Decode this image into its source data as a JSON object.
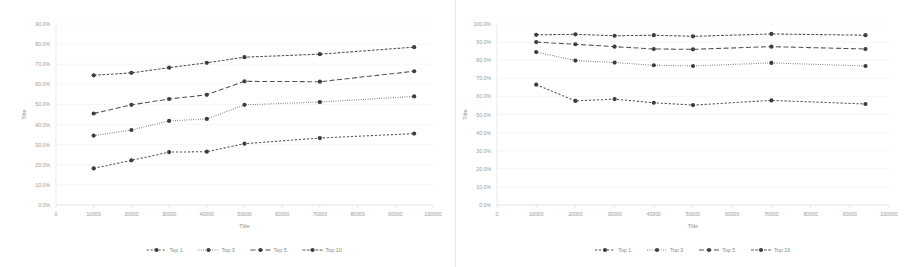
{
  "page": {
    "background": "#ffffff",
    "accent": "#545454",
    "panel_count": 2
  },
  "charts": [
    {
      "id": "left-chart",
      "name": "accuracy-vs-training-size-chart-left",
      "chart_data": {
        "type": "line",
        "title": "",
        "xlabel": "Title",
        "ylabel": "Title",
        "xlim": [
          0,
          100000
        ],
        "ylim": [
          0,
          0.9
        ],
        "xticks": [
          0,
          10000,
          20000,
          30000,
          40000,
          50000,
          60000,
          70000,
          80000,
          90000,
          100000
        ],
        "xticklabels": [
          "0",
          "10000",
          "20000",
          "30000",
          "40000",
          "50000",
          "60000",
          "70000",
          "80000",
          "90000",
          "100000"
        ],
        "yticks": [
          0,
          0.1,
          0.2,
          0.3,
          0.4,
          0.5,
          0.6,
          0.7,
          0.8,
          0.9
        ],
        "yticklabels": [
          "0.0%",
          "10.0%",
          "20.0%",
          "30.0%",
          "40.0%",
          "50.0%",
          "60.0%",
          "70.0%",
          "80.0%",
          "90.0%"
        ],
        "grid": true,
        "legend_position": "bottom",
        "x": [
          10000,
          20000,
          30000,
          40000,
          50000,
          70000,
          95000
        ],
        "series": [
          {
            "name": "Top 1",
            "dash": "2.2 1.8",
            "values": [
              0.182,
              0.222,
              0.263,
              0.265,
              0.305,
              0.333,
              0.355
            ]
          },
          {
            "name": "Top 3",
            "dash": "0.7 1.6",
            "values": [
              0.345,
              0.373,
              0.418,
              0.428,
              0.498,
              0.512,
              0.54
            ]
          },
          {
            "name": "Top 5",
            "dash": "5 2.5",
            "values": [
              0.455,
              0.498,
              0.527,
              0.548,
              0.615,
              0.613,
              0.665
            ]
          },
          {
            "name": "Top 10",
            "dash": "2.8 1.5",
            "values": [
              0.645,
              0.657,
              0.683,
              0.707,
              0.735,
              0.75,
              0.785
            ]
          }
        ]
      }
    },
    {
      "id": "right-chart",
      "name": "accuracy-vs-training-size-chart-right",
      "chart_data": {
        "type": "line",
        "title": "",
        "xlabel": "Title",
        "ylabel": "Title",
        "xlim": [
          0,
          100000
        ],
        "ylim": [
          0,
          1.0
        ],
        "xticks": [
          0,
          10000,
          20000,
          30000,
          40000,
          50000,
          60000,
          70000,
          80000,
          90000,
          100000
        ],
        "xticklabels": [
          "0",
          "10000",
          "20000",
          "30000",
          "40000",
          "50000",
          "60000",
          "70000",
          "80000",
          "90000",
          "100000"
        ],
        "yticks": [
          0,
          0.1,
          0.2,
          0.3,
          0.4,
          0.5,
          0.6,
          0.7,
          0.8,
          0.9,
          1.0
        ],
        "yticklabels": [
          "0.0%",
          "10.0%",
          "20.0%",
          "30.0%",
          "40.0%",
          "50.0%",
          "60.0%",
          "70.0%",
          "80.0%",
          "90.0%",
          "100.0%"
        ],
        "grid": true,
        "legend_position": "bottom",
        "x": [
          10000,
          20000,
          30000,
          40000,
          50000,
          70000,
          94000
        ],
        "series": [
          {
            "name": "Top 1",
            "dash": "2.2 1.8",
            "values": [
              0.665,
              0.575,
              0.585,
              0.565,
              0.552,
              0.578,
              0.558
            ]
          },
          {
            "name": "Top 3",
            "dash": "0.7 1.6",
            "values": [
              0.845,
              0.798,
              0.787,
              0.772,
              0.768,
              0.785,
              0.768
            ]
          },
          {
            "name": "Top 5",
            "dash": "5 2.5",
            "values": [
              0.9,
              0.888,
              0.875,
              0.862,
              0.86,
              0.875,
              0.862
            ]
          },
          {
            "name": "Top 10",
            "dash": "2.8 1.5",
            "values": [
              0.94,
              0.943,
              0.935,
              0.938,
              0.932,
              0.945,
              0.938
            ]
          }
        ]
      }
    }
  ]
}
